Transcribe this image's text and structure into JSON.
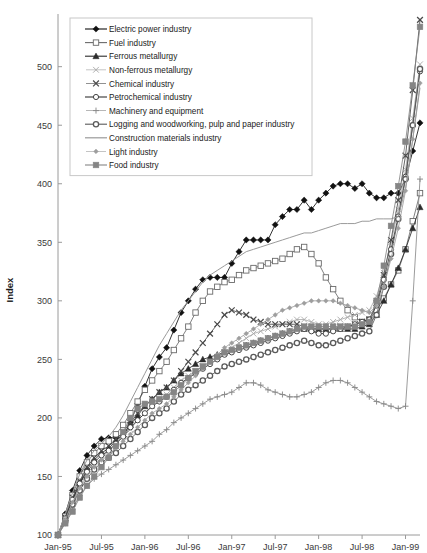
{
  "chart_data": {
    "type": "line",
    "title": "",
    "xlabel": "",
    "ylabel": "Index",
    "ylim": [
      100,
      545
    ],
    "yticks": [
      100,
      150,
      200,
      250,
      300,
      350,
      400,
      450,
      500
    ],
    "grid": false,
    "legend_position": "top-left",
    "x_tick_labels": [
      "Jan-95",
      "Jul-95",
      "Jan-96",
      "Jul-96",
      "Jan-97",
      "Jul-97",
      "Jan-98",
      "Jul-98",
      "Jan-99"
    ],
    "x": [
      "Jan-95",
      "Feb-95",
      "Mar-95",
      "Apr-95",
      "May-95",
      "Jun-95",
      "Jul-95",
      "Aug-95",
      "Sep-95",
      "Oct-95",
      "Nov-95",
      "Dec-95",
      "Jan-96",
      "Feb-96",
      "Mar-96",
      "Apr-96",
      "May-96",
      "Jun-96",
      "Jul-96",
      "Aug-96",
      "Sep-96",
      "Oct-96",
      "Nov-96",
      "Dec-96",
      "Jan-97",
      "Feb-97",
      "Mar-97",
      "Apr-97",
      "May-97",
      "Jun-97",
      "Jul-97",
      "Aug-97",
      "Sep-97",
      "Oct-97",
      "Nov-97",
      "Dec-97",
      "Jan-98",
      "Feb-98",
      "Mar-98",
      "Apr-98",
      "May-98",
      "Jun-98",
      "Jul-98",
      "Aug-98",
      "Sep-98",
      "Oct-98",
      "Nov-98",
      "Dec-98",
      "Jan-99",
      "Feb-99",
      "Mar-99"
    ],
    "series": [
      {
        "name": "Electric power  industry",
        "marker": "filled-diamond",
        "color": "#111111",
        "values": [
          100,
          118,
          138,
          155,
          168,
          176,
          182,
          183,
          183,
          184,
          196,
          212,
          227,
          242,
          252,
          260,
          275,
          290,
          300,
          310,
          318,
          320,
          320,
          320,
          332,
          342,
          352,
          352,
          352,
          352,
          365,
          372,
          378,
          378,
          386,
          378,
          386,
          392,
          398,
          400,
          400,
          396,
          400,
          392,
          388,
          388,
          392,
          392,
          404,
          428,
          452
        ]
      },
      {
        "name": "Fuel industry",
        "marker": "open-square",
        "color": "#6a6a6a",
        "values": [
          100,
          116,
          134,
          150,
          162,
          170,
          176,
          180,
          186,
          194,
          204,
          214,
          224,
          232,
          240,
          248,
          258,
          268,
          278,
          290,
          300,
          308,
          312,
          316,
          318,
          322,
          326,
          328,
          330,
          332,
          334,
          336,
          340,
          344,
          346,
          340,
          332,
          320,
          310,
          300,
          292,
          286,
          282,
          284,
          292,
          302,
          314,
          326,
          344,
          368,
          392
        ]
      },
      {
        "name": "Ferrous metallurgy",
        "marker": "filled-triangle",
        "color": "#2b2b2b",
        "values": [
          100,
          114,
          130,
          144,
          156,
          164,
          170,
          174,
          180,
          186,
          194,
          202,
          210,
          216,
          222,
          226,
          232,
          238,
          242,
          246,
          250,
          252,
          254,
          256,
          258,
          260,
          262,
          264,
          266,
          268,
          270,
          272,
          274,
          276,
          276,
          276,
          276,
          276,
          276,
          276,
          276,
          276,
          278,
          280,
          288,
          300,
          314,
          328,
          344,
          362,
          380
        ]
      },
      {
        "name": "Non-ferrous metallurgy",
        "marker": "light-cross",
        "color": "#a8a8a8",
        "values": [
          100,
          113,
          128,
          142,
          152,
          160,
          166,
          172,
          178,
          184,
          190,
          198,
          204,
          210,
          216,
          220,
          226,
          232,
          236,
          240,
          244,
          248,
          252,
          256,
          260,
          264,
          268,
          272,
          274,
          276,
          278,
          280,
          282,
          284,
          284,
          282,
          280,
          280,
          282,
          284,
          286,
          288,
          290,
          292,
          304,
          324,
          350,
          378,
          412,
          456,
          502
        ]
      },
      {
        "name": "Chemical industry",
        "marker": "dark-cross",
        "color": "#4a4a4a",
        "values": [
          100,
          115,
          132,
          146,
          158,
          166,
          172,
          176,
          182,
          188,
          196,
          204,
          210,
          216,
          222,
          226,
          232,
          240,
          248,
          256,
          264,
          272,
          280,
          288,
          292,
          290,
          288,
          284,
          282,
          280,
          280,
          280,
          280,
          280,
          278,
          276,
          276,
          276,
          276,
          278,
          278,
          280,
          282,
          284,
          298,
          322,
          352,
          386,
          424,
          480,
          540
        ]
      },
      {
        "name": "Petrochemical industry",
        "marker": "open-circle",
        "color": "#333333",
        "values": [
          100,
          114,
          130,
          144,
          154,
          162,
          168,
          172,
          178,
          184,
          192,
          198,
          204,
          210,
          214,
          218,
          224,
          230,
          234,
          238,
          242,
          246,
          250,
          254,
          256,
          258,
          260,
          262,
          264,
          266,
          268,
          270,
          272,
          274,
          276,
          274,
          272,
          272,
          274,
          276,
          278,
          280,
          282,
          284,
          296,
          318,
          344,
          372,
          406,
          450,
          496
        ]
      },
      {
        "name": "Machinery and equipment",
        "marker": "plus",
        "color": "#8a8a8a",
        "values": [
          100,
          110,
          122,
          134,
          142,
          148,
          152,
          156,
          160,
          164,
          168,
          172,
          176,
          180,
          186,
          190,
          196,
          200,
          204,
          208,
          212,
          216,
          218,
          220,
          222,
          226,
          230,
          230,
          228,
          224,
          222,
          220,
          218,
          218,
          220,
          222,
          226,
          230,
          232,
          232,
          230,
          226,
          222,
          218,
          214,
          212,
          210,
          208,
          210,
          300,
          404
        ]
      },
      {
        "name": "Logging and woodworking, pulp and paper industry",
        "marker": "dark-circle",
        "color": "#5a5a5a",
        "values": [
          100,
          112,
          126,
          138,
          148,
          156,
          162,
          166,
          170,
          176,
          182,
          188,
          194,
          200,
          204,
          208,
          214,
          220,
          224,
          228,
          232,
          236,
          240,
          244,
          246,
          248,
          250,
          252,
          254,
          256,
          258,
          260,
          262,
          264,
          266,
          264,
          262,
          262,
          264,
          266,
          268,
          270,
          272,
          274,
          288,
          312,
          340,
          370,
          404,
          450,
          498
        ]
      },
      {
        "name": "Construction materials industry",
        "marker": "line-only",
        "color": "#9a9a9a",
        "values": [
          100,
          118,
          136,
          152,
          164,
          172,
          178,
          184,
          192,
          202,
          214,
          226,
          238,
          250,
          262,
          272,
          282,
          292,
          300,
          308,
          316,
          322,
          326,
          330,
          334,
          338,
          342,
          344,
          346,
          348,
          350,
          352,
          354,
          356,
          358,
          358,
          360,
          362,
          364,
          366,
          366,
          366,
          368,
          368,
          370,
          370,
          370,
          372,
          396,
          438,
          482
        ]
      },
      {
        "name": "Light industry",
        "marker": "small-diamond",
        "color": "#9e9e9e",
        "values": [
          100,
          113,
          128,
          140,
          150,
          158,
          164,
          168,
          174,
          180,
          186,
          192,
          198,
          204,
          208,
          212,
          218,
          224,
          230,
          236,
          242,
          248,
          254,
          260,
          264,
          268,
          272,
          276,
          280,
          284,
          288,
          292,
          294,
          296,
          298,
          300,
          300,
          300,
          300,
          298,
          296,
          294,
          292,
          290,
          296,
          312,
          336,
          362,
          394,
          438,
          486
        ]
      },
      {
        "name": "Food industry",
        "marker": "filled-square-gray",
        "color": "#858585",
        "values": [
          100,
          110,
          120,
          132,
          142,
          150,
          158,
          166,
          176,
          188,
          200,
          208,
          212,
          214,
          216,
          218,
          222,
          228,
          234,
          240,
          244,
          248,
          252,
          256,
          258,
          260,
          262,
          264,
          266,
          268,
          270,
          272,
          274,
          276,
          278,
          278,
          278,
          278,
          278,
          278,
          278,
          278,
          280,
          282,
          300,
          330,
          364,
          398,
          436,
          484,
          534
        ]
      }
    ]
  },
  "legend": {
    "items": [
      {
        "label": "Electric power  industry"
      },
      {
        "label": "Fuel industry"
      },
      {
        "label": "Ferrous metallurgy"
      },
      {
        "label": "Non-ferrous metallurgy"
      },
      {
        "label": "Chemical industry"
      },
      {
        "label": "Petrochemical industry"
      },
      {
        "label": "Machinery and equipment"
      },
      {
        "label": "Logging and woodworking, pulp and paper industry"
      },
      {
        "label": "Construction materials industry"
      },
      {
        "label": "Light industry"
      },
      {
        "label": "Food industry"
      }
    ]
  }
}
